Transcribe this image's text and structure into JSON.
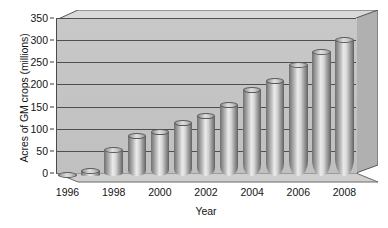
{
  "chart_data": {
    "type": "bar",
    "title": "",
    "xlabel": "Year",
    "ylabel": "Acres of GM crops (millions)",
    "categories": [
      "1996",
      "1997",
      "1998",
      "1999",
      "2000",
      "2001",
      "2002",
      "2003",
      "2004",
      "2005",
      "2006",
      "2007",
      "2008"
    ],
    "values": [
      2,
      12,
      58,
      90,
      100,
      120,
      135,
      160,
      195,
      215,
      250,
      280,
      308
    ],
    "series": [
      {
        "name": "Acres of GM crops (millions)",
        "values": [
          2,
          12,
          58,
          90,
          100,
          120,
          135,
          160,
          195,
          215,
          250,
          280,
          308
        ]
      }
    ],
    "ylim": [
      0,
      350
    ],
    "ytick_values": [
      0,
      50,
      100,
      150,
      200,
      250,
      300,
      350
    ],
    "ytick_labels": [
      "0",
      "50",
      "100",
      "150",
      "200",
      "250",
      "300",
      "350"
    ],
    "xtick_labels": [
      "1996",
      "1998",
      "2000",
      "2002",
      "2004",
      "2006",
      "2008"
    ],
    "xtick_categories": [
      "1996",
      "1998",
      "2000",
      "2002",
      "2004",
      "2006",
      "2008"
    ],
    "grid": true,
    "grid_axis": "y",
    "legend": false,
    "legend_position": "none",
    "style": "3d-cylinder",
    "colors": {
      "plot_background": "#c4c4c4",
      "bar_light": "#ebebeb",
      "bar_dark": "#5e5e5e",
      "gridline": "#4f4f4f",
      "axis": "#2e2e2e",
      "text": "#141414",
      "page_background": "#ffffff"
    }
  }
}
